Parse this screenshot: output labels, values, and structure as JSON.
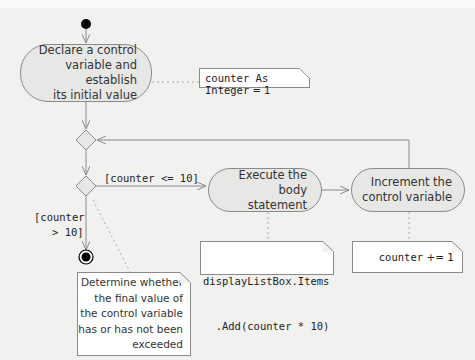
{
  "diagram": {
    "type": "UML activity diagram",
    "nodes": {
      "declare": {
        "lines": [
          "Declare a control",
          "variable and establish",
          "its initial value"
        ]
      },
      "execute": {
        "lines": [
          "Execute the body",
          "statement"
        ]
      },
      "increment": {
        "lines": [
          "Increment the",
          "control variable"
        ]
      }
    },
    "notes": {
      "init": {
        "text_var": "counter As Integer",
        "text_eq": " = 1"
      },
      "body": {
        "lines": [
          "displayListBox.Items",
          "  .Add(counter * 10)"
        ]
      },
      "incr": {
        "text_var": "counter",
        "text_op": " += 1"
      },
      "decision": {
        "lines": [
          "Determine whether",
          "the final value of",
          "the control variable",
          "has or has not been",
          "exceeded"
        ]
      }
    },
    "guards": {
      "true": "[counter <= 10]",
      "false_line1": "[counter",
      "false_line2": "> 10]"
    },
    "colors": {
      "background": "#f1f1f0",
      "activity_fill": "#e7e7e5",
      "stroke": "#8a8a8a",
      "note_fill": "#ffffff",
      "initial_node": "#000000"
    }
  }
}
